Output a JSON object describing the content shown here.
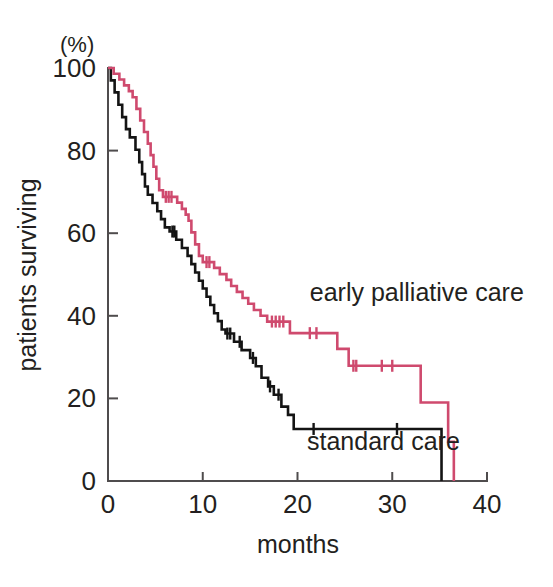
{
  "chart_data": {
    "type": "line",
    "subtype": "kaplan-meier-step",
    "title": "",
    "xlabel": "months",
    "ylabel": "patients surviving",
    "yunit": "(%)",
    "xlim": [
      0,
      40
    ],
    "ylim": [
      0,
      100
    ],
    "xticks": [
      0,
      10,
      20,
      30,
      40
    ],
    "xticklabels": [
      "0",
      "10",
      "20",
      "30",
      "40"
    ],
    "yticks": [
      0,
      20,
      40,
      60,
      80,
      100
    ],
    "yticklabels": [
      "0",
      "20",
      "40",
      "60",
      "80",
      "100"
    ],
    "grid": false,
    "legend_position": "inline-annotation",
    "series": [
      {
        "name": "early palliative care",
        "color": "#cf4a6e",
        "label_x": 21.3,
        "label_y": 43.5,
        "points": [
          [
            0.0,
            100
          ],
          [
            0.6,
            100
          ],
          [
            0.6,
            98.6
          ],
          [
            1.2,
            98.6
          ],
          [
            1.2,
            97.2
          ],
          [
            1.7,
            97.2
          ],
          [
            1.7,
            95.8
          ],
          [
            2.2,
            95.8
          ],
          [
            2.2,
            94.4
          ],
          [
            2.6,
            94.4
          ],
          [
            2.6,
            92.9
          ],
          [
            3.0,
            92.9
          ],
          [
            3.0,
            90.1
          ],
          [
            3.4,
            90.1
          ],
          [
            3.4,
            87.3
          ],
          [
            3.8,
            87.3
          ],
          [
            3.8,
            84.5
          ],
          [
            4.2,
            84.5
          ],
          [
            4.2,
            81.7
          ],
          [
            4.5,
            81.7
          ],
          [
            4.5,
            78.9
          ],
          [
            4.8,
            78.9
          ],
          [
            4.8,
            76.1
          ],
          [
            5.1,
            76.1
          ],
          [
            5.1,
            73.2
          ],
          [
            5.4,
            73.2
          ],
          [
            5.4,
            70.4
          ],
          [
            5.8,
            70.4
          ],
          [
            5.8,
            68.8
          ],
          [
            7.3,
            68.8
          ],
          [
            7.3,
            67.4
          ],
          [
            7.8,
            67.4
          ],
          [
            7.8,
            65.9
          ],
          [
            8.2,
            65.9
          ],
          [
            8.2,
            64.5
          ],
          [
            8.5,
            64.5
          ],
          [
            8.5,
            63.0
          ],
          [
            8.8,
            63.0
          ],
          [
            8.8,
            60.2
          ],
          [
            9.2,
            60.2
          ],
          [
            9.2,
            57.3
          ],
          [
            9.6,
            57.3
          ],
          [
            9.6,
            54.5
          ],
          [
            10.0,
            54.5
          ],
          [
            10.0,
            53.0
          ],
          [
            11.2,
            53.0
          ],
          [
            11.2,
            51.6
          ],
          [
            11.8,
            51.6
          ],
          [
            11.8,
            50.1
          ],
          [
            12.5,
            50.1
          ],
          [
            12.5,
            48.7
          ],
          [
            13.0,
            48.7
          ],
          [
            13.0,
            47.2
          ],
          [
            13.6,
            47.2
          ],
          [
            13.6,
            45.8
          ],
          [
            14.2,
            45.8
          ],
          [
            14.2,
            44.3
          ],
          [
            14.8,
            44.3
          ],
          [
            14.8,
            42.9
          ],
          [
            15.4,
            42.9
          ],
          [
            15.4,
            41.4
          ],
          [
            16.1,
            41.4
          ],
          [
            16.1,
            40.0
          ],
          [
            16.8,
            40.0
          ],
          [
            16.8,
            38.6
          ],
          [
            19.2,
            38.6
          ],
          [
            19.2,
            35.8
          ],
          [
            24.2,
            35.8
          ],
          [
            24.2,
            32.0
          ],
          [
            25.4,
            32.0
          ],
          [
            25.4,
            27.9
          ],
          [
            33.0,
            27.9
          ],
          [
            33.0,
            19.0
          ],
          [
            35.9,
            19.0
          ],
          [
            35.9,
            9.5
          ],
          [
            36.5,
            9.5
          ],
          [
            36.5,
            0.0
          ]
        ],
        "censor_marks": [
          [
            6.1,
            68.8
          ],
          [
            6.4,
            68.8
          ],
          [
            6.7,
            68.8
          ],
          [
            10.4,
            53.0
          ],
          [
            10.7,
            53.0
          ],
          [
            17.3,
            38.6
          ],
          [
            17.7,
            38.6
          ],
          [
            18.1,
            38.6
          ],
          [
            18.5,
            38.6
          ],
          [
            21.3,
            35.8
          ],
          [
            22.0,
            35.8
          ],
          [
            25.9,
            27.9
          ],
          [
            26.2,
            27.9
          ],
          [
            28.9,
            27.9
          ],
          [
            30.0,
            27.9
          ]
        ]
      },
      {
        "name": "standard care",
        "color": "#141414",
        "label_x": 21.0,
        "label_y": 7.5,
        "points": [
          [
            0.0,
            100
          ],
          [
            0.3,
            100
          ],
          [
            0.3,
            97.0
          ],
          [
            0.7,
            97.0
          ],
          [
            0.7,
            94.1
          ],
          [
            1.1,
            94.1
          ],
          [
            1.1,
            91.1
          ],
          [
            1.5,
            91.1
          ],
          [
            1.5,
            88.1
          ],
          [
            1.9,
            88.1
          ],
          [
            1.9,
            85.2
          ],
          [
            2.3,
            85.2
          ],
          [
            2.3,
            83.2
          ],
          [
            2.9,
            83.2
          ],
          [
            2.9,
            80.2
          ],
          [
            3.3,
            80.2
          ],
          [
            3.3,
            77.2
          ],
          [
            3.6,
            77.2
          ],
          [
            3.6,
            74.3
          ],
          [
            3.9,
            74.3
          ],
          [
            3.9,
            71.3
          ],
          [
            4.2,
            71.3
          ],
          [
            4.2,
            69.3
          ],
          [
            4.7,
            69.3
          ],
          [
            4.7,
            67.3
          ],
          [
            5.2,
            67.3
          ],
          [
            5.2,
            65.3
          ],
          [
            5.6,
            65.3
          ],
          [
            5.6,
            63.4
          ],
          [
            6.0,
            63.4
          ],
          [
            6.0,
            61.4
          ],
          [
            6.5,
            61.4
          ],
          [
            6.5,
            60.4
          ],
          [
            7.2,
            60.4
          ],
          [
            7.2,
            58.4
          ],
          [
            7.8,
            58.4
          ],
          [
            7.8,
            56.4
          ],
          [
            8.4,
            56.4
          ],
          [
            8.4,
            54.5
          ],
          [
            8.8,
            54.5
          ],
          [
            8.8,
            52.5
          ],
          [
            9.2,
            52.5
          ],
          [
            9.2,
            50.5
          ],
          [
            9.6,
            50.5
          ],
          [
            9.6,
            48.5
          ],
          [
            10.0,
            48.5
          ],
          [
            10.0,
            46.6
          ],
          [
            10.4,
            46.6
          ],
          [
            10.4,
            44.6
          ],
          [
            10.8,
            44.6
          ],
          [
            10.8,
            42.6
          ],
          [
            11.2,
            42.6
          ],
          [
            11.2,
            40.6
          ],
          [
            11.6,
            40.6
          ],
          [
            11.6,
            38.7
          ],
          [
            12.0,
            38.7
          ],
          [
            12.0,
            36.7
          ],
          [
            12.4,
            36.7
          ],
          [
            12.4,
            35.7
          ],
          [
            13.3,
            35.7
          ],
          [
            13.3,
            33.7
          ],
          [
            14.1,
            33.7
          ],
          [
            14.1,
            31.7
          ],
          [
            15.0,
            31.7
          ],
          [
            15.0,
            29.8
          ],
          [
            15.6,
            29.8
          ],
          [
            15.6,
            27.8
          ],
          [
            16.2,
            27.8
          ],
          [
            16.2,
            25.0
          ],
          [
            16.9,
            25.0
          ],
          [
            16.9,
            22.9
          ],
          [
            17.5,
            22.9
          ],
          [
            17.5,
            20.9
          ],
          [
            18.3,
            20.9
          ],
          [
            18.3,
            18.0
          ],
          [
            19.0,
            18.0
          ],
          [
            19.0,
            16.0
          ],
          [
            19.6,
            16.0
          ],
          [
            19.6,
            12.6
          ],
          [
            35.2,
            12.6
          ],
          [
            35.2,
            0.0
          ]
        ],
        "censor_marks": [
          [
            6.8,
            60.4
          ],
          [
            7.0,
            60.4
          ],
          [
            12.6,
            35.7
          ],
          [
            12.9,
            35.7
          ],
          [
            13.9,
            33.7
          ],
          [
            15.3,
            29.8
          ],
          [
            17.1,
            22.9
          ],
          [
            18.0,
            20.9
          ],
          [
            21.7,
            12.6
          ],
          [
            30.5,
            12.6
          ]
        ]
      }
    ]
  },
  "axes": {
    "y_unit_label": "(%)",
    "y_title": "patients surviving",
    "x_title": "months"
  },
  "colors": {
    "early_palliative": "#cf4a6e",
    "standard": "#141414",
    "axis": "#4f4c4d",
    "text": "#231f20",
    "background": "#ffffff"
  }
}
